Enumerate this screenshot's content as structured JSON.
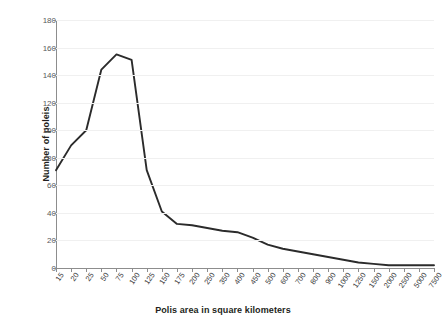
{
  "chart_data": {
    "type": "line",
    "title": "",
    "xlabel": "Polis area in square kilometers",
    "ylabel": "Number of poleis",
    "categories": [
      "15",
      "20",
      "25",
      "50",
      "75",
      "100",
      "125",
      "150",
      "175",
      "200",
      "250",
      "350",
      "400",
      "450",
      "500",
      "600",
      "700",
      "800",
      "900",
      "1000",
      "1250",
      "1500",
      "2000",
      "2500",
      "5000",
      "7500"
    ],
    "values": [
      71,
      89,
      100,
      144,
      155,
      151,
      71,
      41,
      32,
      31,
      29,
      27,
      26,
      22,
      17,
      14,
      12,
      10,
      8,
      6,
      4,
      3,
      2,
      2,
      2,
      2
    ],
    "series": [
      {
        "name": "Number of poleis",
        "values": [
          71,
          89,
          100,
          144,
          155,
          151,
          71,
          41,
          32,
          31,
          29,
          27,
          26,
          22,
          17,
          14,
          12,
          10,
          8,
          6,
          4,
          3,
          2,
          2,
          2,
          2
        ]
      }
    ],
    "ylim": [
      0,
      180
    ],
    "yticks": [
      0,
      20,
      40,
      60,
      80,
      100,
      120,
      140,
      160,
      180
    ],
    "ytick_labels": [
      "0",
      "20",
      "40",
      "60",
      "80",
      "100",
      "120",
      "140",
      "160",
      "180"
    ],
    "grid": true,
    "grid_axis": "y",
    "legend": false,
    "legend_position": "none",
    "line_color": "#2b2b2b",
    "grid_color": "#f0f0f0",
    "axis_color": "#8d8d8d",
    "background_color": "#ffffff",
    "text_color": "#231f20"
  }
}
